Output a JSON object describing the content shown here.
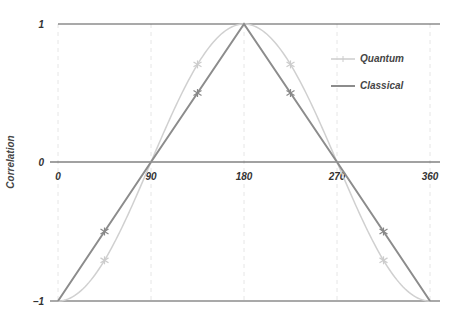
{
  "chart_data": {
    "type": "line",
    "title": "",
    "xlabel": "",
    "ylabel": "Correlation",
    "xlim": [
      0,
      360
    ],
    "ylim": [
      -1,
      1
    ],
    "x_ticks": [
      "0",
      "90",
      "180",
      "270",
      "360"
    ],
    "y_ticks": [
      "1",
      "0",
      "−1"
    ],
    "grid": "vertical dashed at 0, 90, 180, 270, 360",
    "legend_position": "upper right",
    "series": [
      {
        "name": "Quantum",
        "color": "#cccccc",
        "formula": "-cos(theta)",
        "x": [
          0,
          45,
          90,
          135,
          180,
          225,
          270,
          315,
          360
        ],
        "values": [
          -1,
          -0.707,
          0,
          0.707,
          1,
          0.707,
          0,
          -0.707,
          -1
        ],
        "markers_at": [
          45,
          135,
          225,
          315
        ]
      },
      {
        "name": "Classical",
        "color": "#8c8c8c",
        "formula": "piecewise linear",
        "x": [
          0,
          45,
          90,
          135,
          180,
          225,
          270,
          315,
          360
        ],
        "values": [
          -1,
          -0.5,
          0,
          0.5,
          1,
          0.5,
          0,
          -0.5,
          -1
        ],
        "markers_at": [
          45,
          135,
          225,
          315
        ]
      }
    ]
  },
  "legend": {
    "quantum_label": "Quantum",
    "classical_label": "Classical"
  },
  "axes": {
    "ylabel": "Correlation",
    "y_top": "1",
    "y_mid": "0",
    "y_bot": "−1",
    "x0": "0",
    "x90": "90",
    "x180": "180",
    "x270": "270",
    "x360": "360"
  }
}
